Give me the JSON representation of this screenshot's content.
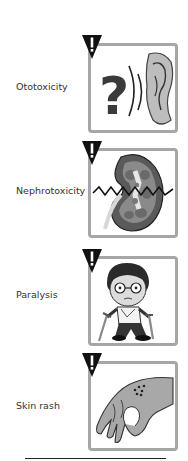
{
  "figure": {
    "panels": [
      {
        "label": "Ototoxicity",
        "icon": "ear-question-icon",
        "warning": "!"
      },
      {
        "label": "Nephrotoxicity",
        "icon": "kidney-icon",
        "warning": "!"
      },
      {
        "label": "Paralysis",
        "icon": "person-crutches-icon",
        "warning": "!"
      },
      {
        "label": "Skin rash",
        "icon": "hand-rash-icon",
        "warning": "!"
      }
    ],
    "colors": {
      "box_border": "#a6a6a6",
      "warning_triangle": "#111111",
      "illustration_grey": "#9a9a9a",
      "label_text": "#333333"
    }
  }
}
